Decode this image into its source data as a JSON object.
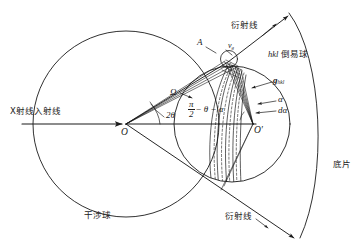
{
  "figure": {
    "title_semantic": "x-ray-diffraction-ewald-construction",
    "background": "#ffffff",
    "stroke": "#1a1a1a"
  },
  "labels": {
    "incident_beam": "X射线入射线",
    "interference_sphere": "干涉球",
    "reciprocal_sphere": "hkl 倒易球",
    "reciprocal_sphere_italic": "hkl",
    "reciprocal_sphere_cjk": " 倒易球",
    "diffraction_line_top": "衍射线",
    "diffraction_line_bottom": "衍射线",
    "film": "底片",
    "point_A": "A",
    "point_O": "O",
    "point_O_prime": "O′",
    "vector_vg": "v",
    "vector_vg_sub": "g",
    "vector_g": "g",
    "vector_g_sub": "hkl",
    "angle_omega": "Ω",
    "angle_two_theta": "2θ",
    "angle_alpha": "α",
    "angle_dalpha": "dα",
    "formula_num": "π",
    "formula_den": "2",
    "formula_tail": "− θ − α"
  },
  "geometry": {
    "interference_sphere": {
      "cx": 126,
      "cy": 124,
      "r": 93
    },
    "reciprocal_sphere": {
      "cx": 232,
      "cy": 124,
      "r": 58
    },
    "center_O": {
      "x": 126,
      "y": 124
    },
    "center_O_prime": {
      "x": 253,
      "y": 124
    },
    "node_top": {
      "x": 228,
      "y": 62
    },
    "node_bottom": {
      "x": 222,
      "y": 189
    },
    "small_circle": {
      "cx": 228,
      "cy": 58,
      "r": 9
    },
    "incident_arrow": {
      "x1": 22,
      "y1": 124,
      "x2": 126,
      "y2": 124
    },
    "film_arc": {
      "start": [
        290,
        14
      ],
      "end": [
        300,
        236
      ]
    },
    "diffraction_top_arrow": {
      "x1": 208,
      "y1": 76,
      "x2": 290,
      "y2": 12
    },
    "diffraction_bottom_arrow": {
      "x1": 208,
      "y1": 160,
      "x2": 296,
      "y2": 240
    }
  }
}
